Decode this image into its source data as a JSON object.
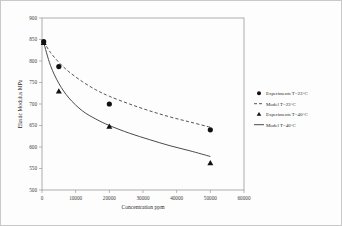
{
  "chart_data": {
    "type": "scatter",
    "title": "",
    "xlabel": "Concentration ppm",
    "ylabel": "Elastic Modulus MPa",
    "xlim": [
      0,
      60000
    ],
    "ylim": [
      500,
      900
    ],
    "xticks": [
      "0",
      "10000",
      "20000",
      "30000",
      "40000",
      "50000",
      "60000"
    ],
    "xtick_values": [
      0,
      10000,
      20000,
      30000,
      40000,
      50000,
      60000
    ],
    "yticks": [
      "500",
      "550",
      "600",
      "650",
      "700",
      "750",
      "800",
      "850",
      "900"
    ],
    "ytick_values": [
      500,
      550,
      600,
      650,
      700,
      750,
      800,
      850,
      900
    ],
    "grid": false,
    "legend_position": "right-outside",
    "series": [
      {
        "name": "Experiments T=23°C",
        "marker": "circle",
        "kind": "points",
        "color": "#111111",
        "x": [
          500,
          5000,
          20000,
          50000
        ],
        "values": [
          845,
          787,
          700,
          640
        ]
      },
      {
        "name": "Model T=23°C",
        "marker": "dashed-line",
        "kind": "curve",
        "color": "#555555",
        "x": [
          500,
          2500,
          5000,
          8000,
          12000,
          16000,
          20000,
          26000,
          32000,
          38000,
          44000,
          50000
        ],
        "values": [
          845,
          820,
          797,
          775,
          752,
          733,
          718,
          700,
          684,
          670,
          658,
          646
        ]
      },
      {
        "name": "Experiments T=40°C",
        "marker": "triangle",
        "kind": "points",
        "color": "#111111",
        "x": [
          500,
          5000,
          20000,
          50000
        ],
        "values": [
          843,
          730,
          648,
          563
        ]
      },
      {
        "name": "Model T=40°C",
        "marker": "solid-line",
        "kind": "curve",
        "color": "#4a4a4a",
        "x": [
          500,
          2500,
          5000,
          8000,
          12000,
          16000,
          20000,
          26000,
          32000,
          38000,
          44000,
          50000
        ],
        "values": [
          843,
          790,
          748,
          714,
          684,
          665,
          650,
          632,
          617,
          603,
          591,
          578
        ]
      }
    ]
  },
  "legend": {
    "items": [
      {
        "label": "Experiments T=23°C",
        "marker": "circle"
      },
      {
        "label": "Model T=23°C",
        "marker": "dashed-line"
      },
      {
        "label": "Experiments T=40°C",
        "marker": "triangle"
      },
      {
        "label": "Model T=40°C",
        "marker": "solid-line"
      }
    ]
  },
  "axes": {
    "x_title": "Concentration ppm",
    "y_title": "Elastic Modulus MPa"
  },
  "colors": {
    "frame": "#c9c9c9",
    "axis": "#9a9a9a",
    "marker": "#111111",
    "model23": "#555555",
    "model40": "#4a4a4a",
    "background": "#fdfdfd"
  }
}
